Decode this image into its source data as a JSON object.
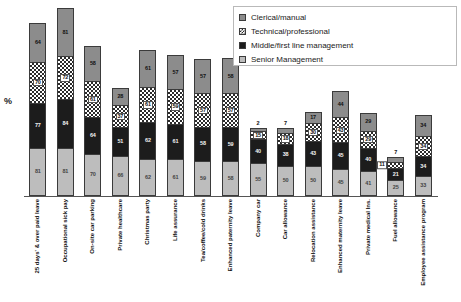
{
  "chart_data": {
    "type": "bar",
    "subtype": "stacked-column",
    "title": "",
    "xlabel": "",
    "ylabel": "%",
    "ylim": [
      0,
      300
    ],
    "grid": false,
    "legend_position": "top-right",
    "categories": [
      "25 days' & over paid leave",
      "Occupational sick pay",
      "On-site car parking",
      "Private healthcare",
      "Christmas party",
      "Life assurance",
      "Tea/coffee/cold drinks",
      "Enhanced paternity leave",
      "Company car",
      "Car allowance",
      "Relocation assistance",
      "Enhanced maternity leave",
      "Private medical Ins.",
      "Fuel allowance",
      "Employee assistance program"
    ],
    "series": [
      {
        "name": "Senior Management",
        "values": [
          81,
          81,
          70,
          66,
          62,
          61,
          59,
          58,
          55,
          50,
          50,
          45,
          41,
          25,
          33
        ]
      },
      {
        "name": "Middle/first line management",
        "values": [
          77,
          84,
          64,
          51,
          62,
          61,
          58,
          59,
          40,
          38,
          43,
          45,
          40,
          21,
          34
        ]
      },
      {
        "name": "Technical/professional",
        "values": [
          70,
          72,
          61,
          37,
          61,
          59,
          57,
          57,
          15,
          18,
          30,
          43,
          29,
          11,
          34
        ]
      },
      {
        "name": "Clerical/manual",
        "values": [
          64,
          81,
          58,
          28,
          61,
          57,
          57,
          58,
          2,
          7,
          17,
          44,
          29,
          7,
          34
        ]
      }
    ]
  },
  "legend": {
    "items": [
      {
        "label": "Clerical/manual",
        "key": "clerical"
      },
      {
        "label": "Technical/professional",
        "key": "technical"
      },
      {
        "label": "Middle/first line management",
        "key": "middle"
      },
      {
        "label": "Senior Management",
        "key": "senior"
      }
    ]
  },
  "axis": {
    "y_title": "%"
  },
  "colors": {
    "clerical": "#8c8c8c",
    "technical": "#2b2b2b",
    "middle": "#1c1c1c",
    "senior": "#bdbdbd",
    "background": "#ffffff",
    "axis": "#555555"
  }
}
